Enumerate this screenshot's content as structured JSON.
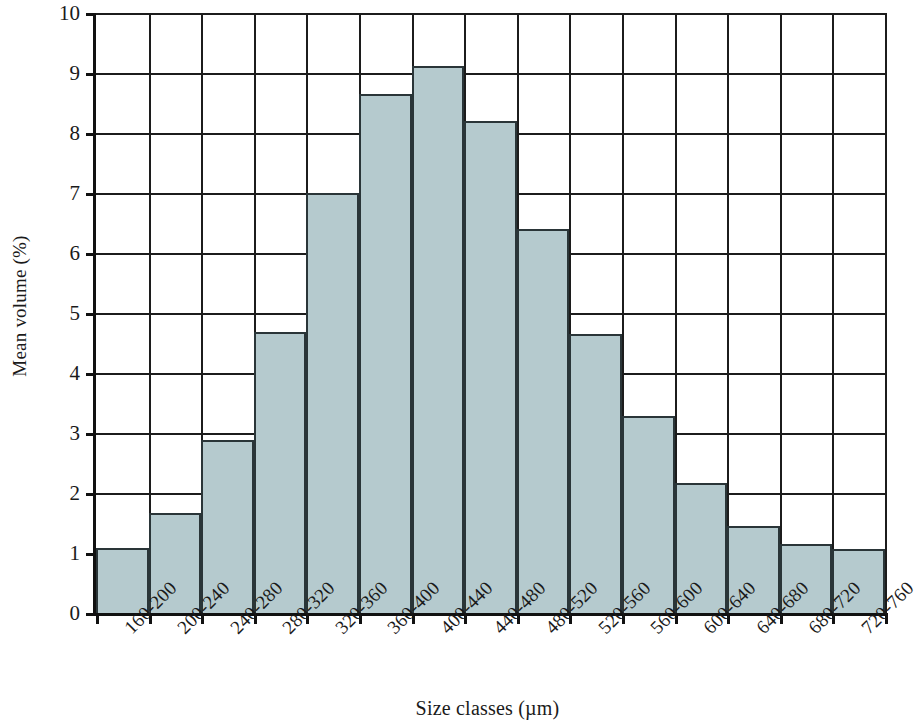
{
  "chart_data": {
    "type": "bar",
    "title": "",
    "subtitle": "",
    "xlabel": "Size classes (µm)",
    "ylabel": "Mean volume (%)",
    "categories": [
      "160-200",
      "200-240",
      "240-280",
      "280-320",
      "320-360",
      "360-400",
      "400-440",
      "440-480",
      "480-520",
      "520-560",
      "560-600",
      "600-640",
      "640-680",
      "680-720",
      "720-760"
    ],
    "values": [
      1.08,
      1.67,
      2.88,
      4.68,
      7.0,
      8.65,
      9.12,
      8.2,
      6.4,
      4.65,
      3.28,
      2.17,
      1.45,
      1.15,
      1.07
    ],
    "ylim": [
      0,
      10
    ],
    "yticks": [
      0,
      1,
      2,
      3,
      4,
      5,
      6,
      7,
      8,
      9,
      10
    ],
    "ytick_labels": [
      "0",
      "1",
      "2",
      "3",
      "4",
      "5",
      "6",
      "7",
      "8",
      "9",
      "10"
    ],
    "grid": "horizontal-and-vertical",
    "legend": "none",
    "bar_fill_color": "#b5cace",
    "bar_edge_color": "#2a3538",
    "axis_color": "#111111",
    "background_color": "#ffffff",
    "annotations": []
  }
}
